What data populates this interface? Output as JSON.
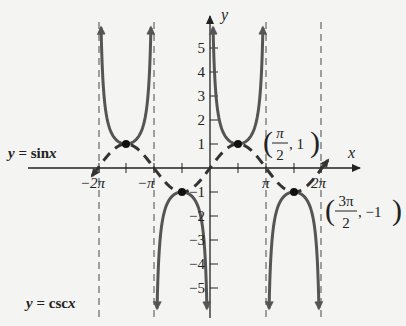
{
  "chart_data": {
    "type": "line",
    "title": "",
    "xlabel": "x",
    "ylabel": "y",
    "xlim": [
      -6.6,
      6.9
    ],
    "ylim": [
      -5.8,
      5.8
    ],
    "grid": false,
    "x_ticks": [
      {
        "value": -6.2832,
        "label": "−2π"
      },
      {
        "value": -3.1416,
        "label": "−π"
      },
      {
        "value": 3.1416,
        "label": "π"
      },
      {
        "value": 6.2832,
        "label": "2π"
      }
    ],
    "y_ticks": [
      {
        "value": 5,
        "label": "5"
      },
      {
        "value": 4,
        "label": "4"
      },
      {
        "value": 3,
        "label": "3"
      },
      {
        "value": 2,
        "label": "2"
      },
      {
        "value": 1,
        "label": "1"
      },
      {
        "value": -1,
        "label": "−1"
      },
      {
        "value": -2,
        "label": "−2"
      },
      {
        "value": -3,
        "label": "−3"
      },
      {
        "value": -4,
        "label": "−4"
      },
      {
        "value": -5,
        "label": "−5"
      }
    ],
    "series": [
      {
        "name": "y = sin x",
        "style": "dashed",
        "function": "sin(x)",
        "domain": [
          -6.6,
          6.6
        ]
      },
      {
        "name": "y = csc x",
        "style": "solid",
        "function": "1/sin(x)",
        "domain": [
          -6.2832,
          6.2832
        ]
      }
    ],
    "asymptotes": [
      -6.2832,
      -3.1416,
      3.1416,
      6.2832
    ],
    "annotations": [
      {
        "point": [
          1.5708,
          1
        ],
        "label_num": "π",
        "label_den": "2",
        "label_y": "1"
      },
      {
        "point": [
          4.7124,
          -1
        ],
        "label_num": "3π",
        "label_den": "2",
        "label_y": "−1"
      },
      {
        "point": [
          -4.7124,
          1
        ],
        "label": ""
      },
      {
        "point": [
          -1.5708,
          -1
        ],
        "label": ""
      }
    ],
    "legend": {
      "sin_label": "y = sin x",
      "csc_label": "y = csc x"
    }
  },
  "labels": {
    "x_axis": "x",
    "y_axis": "y",
    "sin_eq_y": "y",
    "sin_eq_rest": " = sin",
    "sin_eq_x": "x",
    "csc_eq_y": "y",
    "csc_eq_rest": " = csc",
    "csc_eq_x": "x",
    "pt1_num": "π",
    "pt1_den": "2",
    "pt1_y": ", 1",
    "pt2_num": "3π",
    "pt2_den": "2",
    "pt2_y": ", −1",
    "tick_neg2pi": "−2π",
    "tick_negpi": "−π",
    "tick_pi": "π",
    "tick_2pi": "2π",
    "y5": "5",
    "y4": "4",
    "y3": "3",
    "y2": "2",
    "y1": "1",
    "yn1": "−1",
    "yn2": "−2",
    "yn3": "−3",
    "yn4": "−4",
    "yn5": "−5"
  },
  "colors": {
    "curve": "#555555",
    "axis": "#222222",
    "asymptote": "#666666",
    "background": "#f4f4f2"
  }
}
